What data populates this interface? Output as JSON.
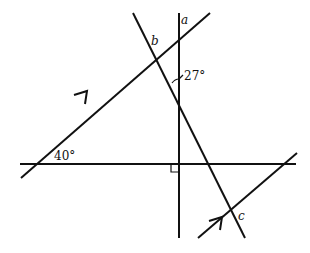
{
  "diagram": {
    "type": "geometry-angles-parallel-lines",
    "labels": {
      "a": "a",
      "b": "b",
      "c": "c",
      "angle_27": "27°",
      "angle_40": "40°"
    },
    "lines": [
      {
        "id": "vertical",
        "x1": 179,
        "y1": 13,
        "x2": 179,
        "y2": 238
      },
      {
        "id": "horizontal",
        "x1": 20,
        "y1": 164,
        "x2": 296,
        "y2": 164
      },
      {
        "id": "transversal-diagonal",
        "x1": 133,
        "y1": 13,
        "x2": 245,
        "y2": 238
      },
      {
        "id": "parallel-upper",
        "x1": 21,
        "y1": 178,
        "x2": 210,
        "y2": 13
      },
      {
        "id": "parallel-lower",
        "x1": 198,
        "y1": 238,
        "x2": 297,
        "y2": 153
      }
    ],
    "markers": {
      "right_angle": "at intersection of vertical and horizontal (lower-left)",
      "parallel_arrows": 2
    },
    "colors": {
      "stroke": "#111111",
      "background": "#ffffff"
    }
  }
}
